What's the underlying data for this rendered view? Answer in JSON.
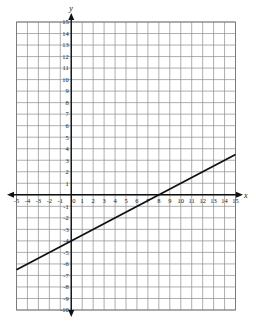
{
  "chart_data": {
    "type": "line",
    "title": "",
    "xlabel": "x",
    "ylabel": "y",
    "xlim": [
      -5,
      15
    ],
    "ylim": [
      -10,
      15
    ],
    "grid": true,
    "x_ticks": [
      -5,
      -4,
      -3,
      -2,
      -1,
      0,
      1,
      2,
      3,
      4,
      5,
      6,
      7,
      8,
      9,
      10,
      11,
      12,
      13,
      14,
      15
    ],
    "x_tick_labels": [
      "-5",
      "-4",
      "-3",
      "-2",
      "-1",
      "0",
      "1",
      "2",
      "3",
      "4",
      "5",
      "6",
      "7",
      "8",
      "9",
      "10",
      "11",
      "12",
      "13",
      "14",
      "15"
    ],
    "y_ticks": [
      15,
      14,
      13,
      12,
      11,
      10,
      9,
      8,
      7,
      6,
      5,
      4,
      3,
      2,
      1,
      -1,
      -2,
      -3,
      -4,
      -5,
      -6,
      -7,
      -8,
      -9,
      -10
    ],
    "y_tick_labels": [
      "15",
      "14",
      "13",
      "12",
      "11",
      "10",
      "9",
      "8",
      "7",
      "6",
      "5",
      "4",
      "3",
      "2",
      "1",
      "-1",
      "-2",
      "-3",
      "-4",
      "-5",
      "-6",
      "-7",
      "-8",
      "-9",
      "-10"
    ],
    "series": [
      {
        "name": "line",
        "equation": "y = 0.5x - 4",
        "slope": 0.5,
        "intercept": -4,
        "x": [
          -5,
          15
        ],
        "y": [
          -6.5,
          3.5
        ]
      }
    ],
    "legend": null,
    "colors": {
      "grid": "#8c8c8c",
      "axis": "#111111",
      "line": "#111111"
    }
  }
}
